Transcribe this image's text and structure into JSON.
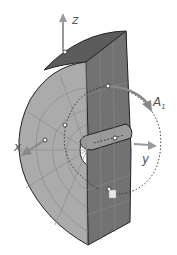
{
  "diagram": {
    "type": "3d-solid-with-coordinate-axes",
    "labels": {
      "z": "z",
      "x": "x",
      "y": "y",
      "rotation_axis": "A",
      "rotation_axis_sub": "1"
    },
    "colors": {
      "background": "#ffffff",
      "front_face": "#a9a9a9",
      "side_face": "#6e6e6e",
      "top_face": "#5a5a5a",
      "edge": "#222222",
      "grid": "#8c8c8c",
      "axis_arrow": "#9a9a9a",
      "dotted_path": "#333333"
    }
  }
}
